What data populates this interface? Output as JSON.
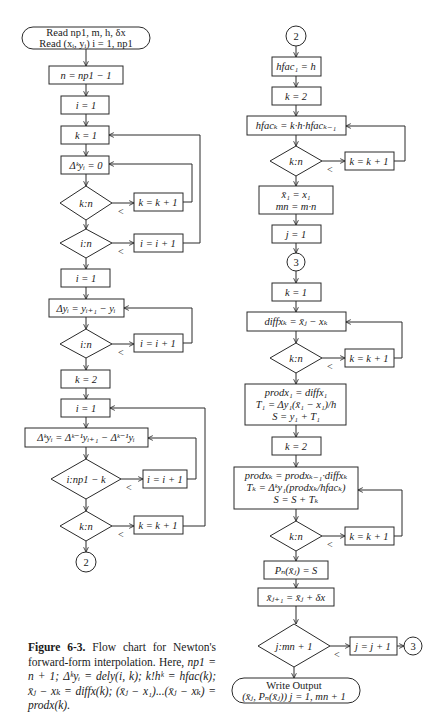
{
  "figure": {
    "caption_label": "Figure 6-3.",
    "caption_text": "Flow chart for Newton's forward-form interpolation. Here,",
    "caption_defs": "np1 = n + 1; Δᵏyᵢ = dely(i, k); k!hᵏ = hfac(k); x̄ⱼ − xₖ = diffx(k); (x̄ⱼ − x₁)...(x̄ⱼ − xₖ) = prodx(k)."
  },
  "left_column": {
    "start": {
      "line1": "Read np1, m, h, δx",
      "line2": "Read (xᵢ, yᵢ)   i = 1, np1"
    },
    "n_init": "n = np1 − 1",
    "i_init1": "i = 1",
    "k_init1": "k = 1",
    "dky_zero": "Δᵏyᵢ = 0",
    "dec_k_n1": "k:n",
    "k_inc1": "k = k + 1",
    "dec_i_n1": "i:n",
    "i_inc1": "i = i + 1",
    "i_init2": "i = 1",
    "dy": "Δyᵢ = yᵢ₊₁ − yᵢ",
    "dec_i_n2": "i:n",
    "i_inc2": "i = i + 1",
    "k_init2": "k = 2",
    "i_init3": "i = 1",
    "dky": "Δᵏyᵢ = Δᵏ⁻¹yᵢ₊₁ − Δᵏ⁻¹yᵢ",
    "dec_i_np1k": "i:np1 − k",
    "i_inc3": "i = i + 1",
    "dec_k_n2": "k:n",
    "k_inc2": "k = k + 1",
    "connector_out": "2"
  },
  "right_column": {
    "connector_in": "2",
    "hfac1": "hfac₁ = h",
    "k_init1": "k = 2",
    "hfack": "hfacₖ = k·h·hfacₖ₋₁",
    "dec_k_n1": "k:n",
    "k_inc1": "k = k + 1",
    "init_x_line1": "x̄₁ = x₁",
    "init_x_line2": "mn = m·n",
    "j_init": "j = 1",
    "connector3": "3",
    "k_init2": "k = 1",
    "diffx": "diffxₖ = x̄ⱼ − xₖ",
    "dec_k_n2": "k:n",
    "k_inc2": "k = k + 1",
    "block1_line1": "prodx₁ = diffx₁",
    "block1_line2": "T₁ = Δy₁(x̄₁ − x₁)/h",
    "block1_line3": "S = y₁ + T₁",
    "k_init3": "k = 2",
    "block2_line1": "prodxₖ = prodxₖ₋₁·diffxₖ",
    "block2_line2": "Tₖ = Δᵏy₁(prodxₖ/hfacₖ)",
    "block2_line3": "S = S + Tₖ",
    "dec_k_n3": "k:n",
    "k_inc3": "k = k + 1",
    "pn": "Pₙ(x̄ⱼ) = S",
    "x_next": "x̄ⱼ₊₁ = x̄ⱼ + δx",
    "dec_j_mn": "j:mn + 1",
    "j_inc": "j = j + 1",
    "connector3_out": "3",
    "end_line1": "Write Output",
    "end_line2": "(x̄ⱼ, Pₙ(x̄ⱼ))      j = 1, mn + 1"
  },
  "branch_label": "<"
}
